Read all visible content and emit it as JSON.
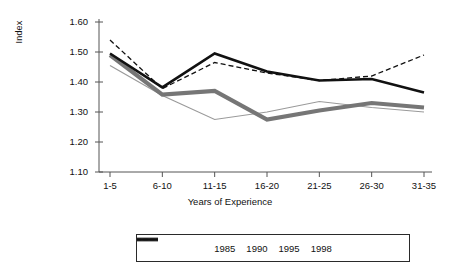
{
  "chart_data": {
    "type": "line",
    "title": "",
    "xlabel": "Years of Experience",
    "ylabel": "Index",
    "categories": [
      "1-5",
      "6-10",
      "11-15",
      "16-20",
      "21-25",
      "26-30",
      "31-35"
    ],
    "ylim": [
      1.1,
      1.6
    ],
    "yticks": [
      "1.10",
      "1.20",
      "1.30",
      "1.40",
      "1.50",
      "1.60"
    ],
    "ytick_values": [
      1.1,
      1.2,
      1.3,
      1.4,
      1.5,
      1.6
    ],
    "grid": false,
    "legend_position": "bottom",
    "series": [
      {
        "name": "1985",
        "style": "thin-solid",
        "color": "#9a9a9a",
        "width": 1.2,
        "dash": "",
        "values": [
          1.455,
          1.355,
          1.275,
          1.3,
          1.335,
          1.315,
          1.3
        ]
      },
      {
        "name": "1990",
        "style": "thick-solid",
        "color": "#767676",
        "width": 4.2,
        "dash": "",
        "values": [
          1.49,
          1.358,
          1.37,
          1.275,
          1.305,
          1.33,
          1.315
        ]
      },
      {
        "name": "1995",
        "style": "thick-solid",
        "color": "#111111",
        "width": 2.6,
        "dash": "",
        "values": [
          1.495,
          1.382,
          1.495,
          1.435,
          1.405,
          1.41,
          1.365
        ]
      },
      {
        "name": "1998",
        "style": "dashed",
        "color": "#111111",
        "width": 1.3,
        "dash": "5,3",
        "values": [
          1.54,
          1.378,
          1.465,
          1.43,
          1.405,
          1.42,
          1.49
        ]
      }
    ]
  },
  "axis": {
    "y_tick_mark": "tick",
    "x_tick_mark": "tick"
  }
}
